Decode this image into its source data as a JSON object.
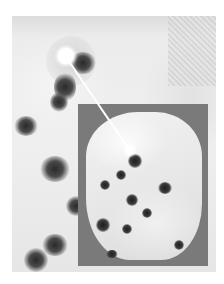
{
  "figure": {
    "background_color": "#ebebeb",
    "inset_background_color": "#7a7a7a",
    "marker_color": "#ffffff"
  },
  "annotations": {
    "main_marker": {
      "x": 66,
      "y": 56,
      "r": 8
    },
    "inset_marker": {
      "x": 130,
      "y": 150,
      "r": 4
    },
    "pointer": {
      "from": [
        66,
        56
      ],
      "to": [
        130,
        150
      ]
    }
  }
}
